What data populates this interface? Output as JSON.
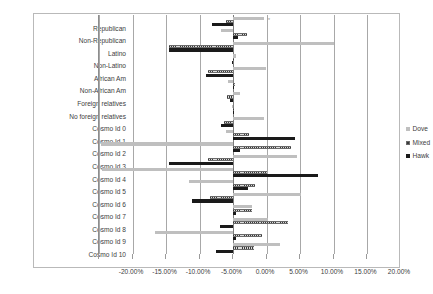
{
  "chart_data": {
    "type": "bar",
    "orientation": "horizontal",
    "title": "",
    "subtitle": "",
    "xlabel": "",
    "ylabel": "",
    "xlim": [
      -0.2,
      0.2
    ],
    "xtick_values": [
      -0.2,
      -0.15,
      -0.1,
      -0.05,
      0.0,
      0.05,
      0.1,
      0.15,
      0.2
    ],
    "xtick_labels": [
      "-20.00%",
      "-15.00%",
      "-10.00%",
      "-5.00%",
      "0.00%",
      "5.00%",
      "10.00%",
      "15.00%",
      "20.00%"
    ],
    "grid": true,
    "grid_axis": "x",
    "legend_position": "right",
    "legend": [
      "Dove",
      "Mixed",
      "Hawk"
    ],
    "categories": [
      "Republican",
      "Non-Republican",
      "Latino",
      "Non-Latino",
      "African Am",
      "Non-African Am",
      "Foreign relatives",
      "No foreign relatives",
      "Cosmo Id 0",
      "Cosmo Id 1",
      "Cosmo Id 2",
      "Cosmo Id 3",
      "Cosmo Id 4",
      "Cosmo Id 5",
      "Cosmo Id 6",
      "Cosmo Id 7",
      "Cosmo Id 8",
      "Cosmo Id 9",
      "Cosmo Id 10"
    ],
    "series": [
      {
        "name": "Dove",
        "color": "#bfbfbf",
        "values": [
          0.047,
          -0.018,
          0.151,
          0.004,
          0.049,
          -0.007,
          0.01,
          -0.002,
          0.046,
          -0.01,
          -0.197,
          0.095,
          -0.195,
          -0.065,
          0.101,
          0.029,
          0.052,
          -0.116,
          0.07
        ]
      },
      {
        "name": "Mixed",
        "color": "#b3b3b3",
        "pattern": "hatched",
        "values": [
          -0.011,
          0.021,
          -0.095,
          0.002,
          -0.038,
          0.003,
          -0.009,
          0.002,
          -0.013,
          0.024,
          0.086,
          -0.037,
          0.05,
          0.033,
          -0.035,
          0.028,
          0.082,
          0.043,
          0.031
        ]
      },
      {
        "name": "Hawk",
        "color": "#1a1a1a",
        "values": [
          -0.031,
          0.008,
          -0.096,
          -0.002,
          -0.041,
          0.002,
          -0.004,
          0.0,
          -0.018,
          0.093,
          0.011,
          -0.096,
          0.127,
          0.022,
          -0.061,
          0.005,
          -0.02,
          0.004,
          -0.025
        ]
      }
    ],
    "annotations": [
      {
        "text": "*",
        "near_category": "Republican",
        "value": 0.05
      },
      {
        "text": "*",
        "near_category": "Cosmo Id 4",
        "value": -0.2
      }
    ]
  }
}
